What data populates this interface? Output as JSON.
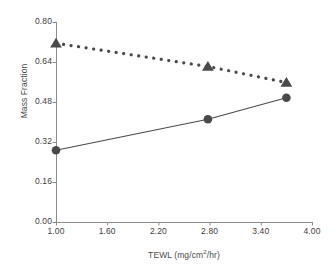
{
  "chart_data": {
    "type": "line",
    "title": "",
    "xlabel": "TEWL (mg/cm2/hr)",
    "xlabel_parts": {
      "pre": "TEWL (mg/cm",
      "sup": "2",
      "post": "/hr)"
    },
    "ylabel": "Mass Fraction",
    "xlim": [
      1.0,
      4.0
    ],
    "ylim": [
      0.0,
      0.8
    ],
    "grid": false,
    "legend": "none",
    "xticks": [
      "1.00",
      "1.60",
      "2.20",
      "2.80",
      "3.40",
      "4.00"
    ],
    "xtick_values": [
      1.0,
      1.6,
      2.2,
      2.8,
      3.4,
      4.0
    ],
    "yticks": [
      "0.00",
      "0.16",
      "0.32",
      "0.48",
      "0.64",
      "0.80"
    ],
    "ytick_values": [
      0.0,
      0.16,
      0.32,
      0.48,
      0.64,
      0.8
    ],
    "series": [
      {
        "name": "triangle-series",
        "marker": "triangle",
        "linestyle": "dotted",
        "color": "#4a4a4a",
        "x": [
          1.0,
          2.78,
          3.7
        ],
        "values": [
          0.715,
          0.622,
          0.558
        ]
      },
      {
        "name": "circle-series",
        "marker": "circle",
        "linestyle": "solid",
        "color": "#4a4a4a",
        "x": [
          1.0,
          2.78,
          3.7
        ],
        "values": [
          0.287,
          0.411,
          0.497
        ]
      }
    ]
  }
}
